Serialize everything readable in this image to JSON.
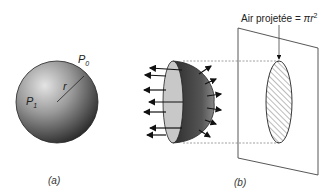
{
  "panel_a": {
    "caption": "(a)",
    "labels": {
      "outer_pressure": "P",
      "outer_pressure_sub": "0",
      "inner_pressure": "P",
      "inner_pressure_sub": "1",
      "radius": "r"
    },
    "colors": {
      "sphere_light": "#d8d8d8",
      "sphere_dark": "#2a2a2a"
    }
  },
  "panel_b": {
    "caption": "(b)",
    "projection_label": "Air projetée = ",
    "projection_formula_pi": "π",
    "projection_formula_r": "r",
    "projection_formula_exp": "2",
    "arrows": {
      "left_count": 5,
      "dome_count": 7
    },
    "colors": {
      "flat_face": "#c8c8c8",
      "dome_dark": "#3a3a3a",
      "plane_line": "#444444",
      "hatch": "#777777"
    }
  }
}
